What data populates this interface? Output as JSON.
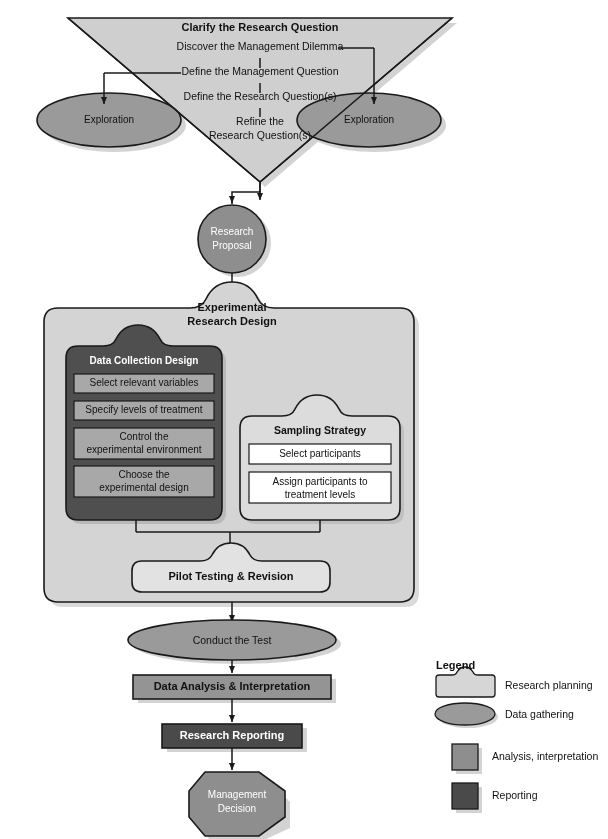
{
  "diagram": {
    "funnel": {
      "heading": "Clarify the Research Question",
      "steps": [
        "Discover the Management Dilemma",
        "Define the Management Question",
        "Define the Research Question(s)",
        "Refine the",
        "Research Question(s)"
      ],
      "step_refine_line1": "Refine the",
      "step_refine_line2": "Research Question(s)",
      "exploration_left": "Exploration",
      "exploration_right": "Exploration"
    },
    "proposal": {
      "line1": "Research",
      "line2": "Proposal"
    },
    "design_container": {
      "title_line1": "Experimental",
      "title_line2": "Research Design"
    },
    "data_collection": {
      "title": "Data Collection Design",
      "items": [
        {
          "line1": "Select relevant variables",
          "line2": ""
        },
        {
          "line1": "Specify levels of treatment",
          "line2": ""
        },
        {
          "line1": "Control the",
          "line2": "experimental environment"
        },
        {
          "line1": "Choose the",
          "line2": "experimental design"
        }
      ]
    },
    "sampling": {
      "title": "Sampling Strategy",
      "items": [
        {
          "line1": "Select participants",
          "line2": ""
        },
        {
          "line1": "Assign participants to",
          "line2": "treatment levels"
        }
      ]
    },
    "pilot": "Pilot Testing & Revision",
    "conduct": "Conduct the Test",
    "analysis": "Data Analysis & Interpretation",
    "reporting": "Research Reporting",
    "decision": {
      "line1": "Management",
      "line2": "Decision"
    }
  },
  "legend": {
    "title": "Legend",
    "items": [
      {
        "label": "Research planning",
        "shape": "notched-box",
        "color": "#d6d6d6"
      },
      {
        "label": "Data gathering",
        "shape": "ellipse",
        "color": "#9a9a9a"
      },
      {
        "label": "Analysis, interpretation",
        "shape": "square",
        "color": "#8e8e8e"
      },
      {
        "label": "Reporting",
        "shape": "square",
        "color": "#4a4a4a"
      }
    ]
  },
  "colors": {
    "funnel_fill": "#cfcfcf",
    "exploration_fill": "#9a9a9a",
    "proposal_fill": "#8e8e8e",
    "container_fill": "#d4d4d4",
    "data_collection_fill": "#4f4f4f",
    "data_collection_item_fill": "#a8a8a8",
    "sampling_fill": "#dcdcdc",
    "sampling_item_fill": "#ffffff",
    "pilot_fill": "#e2e2e2",
    "conduct_fill": "#9a9a9a",
    "analysis_fill": "#949494",
    "reporting_fill": "#4a4a4a",
    "decision_fill": "#8e8e8e",
    "stroke": "#1a1a1a",
    "shadow": "#b0b0b0"
  }
}
